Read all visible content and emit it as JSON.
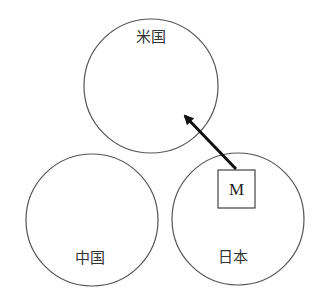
{
  "diagram": {
    "circles": [
      {
        "id": "us",
        "label": "米国",
        "cx": 151,
        "cy": 86,
        "r": 67,
        "label_x": 151,
        "label_y": 42
      },
      {
        "id": "china",
        "label": "中国",
        "cx": 92,
        "cy": 220,
        "r": 66,
        "label_x": 90,
        "label_y": 263
      },
      {
        "id": "japan",
        "label": "日本",
        "cx": 238,
        "cy": 219,
        "r": 66,
        "label_x": 233,
        "label_y": 262
      }
    ],
    "box": {
      "label": "M",
      "x": 218,
      "y": 170,
      "w": 37,
      "h": 38,
      "location": "japan"
    },
    "arrow": {
      "from": "M",
      "to": "米国",
      "x1": 236,
      "y1": 169,
      "x2": 183,
      "y2": 114
    },
    "colors": {
      "stroke": "#555555",
      "arrow": "#111111",
      "text": "#333333"
    }
  }
}
